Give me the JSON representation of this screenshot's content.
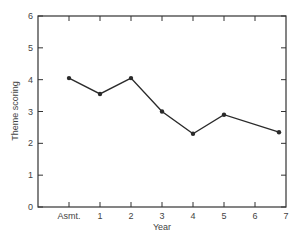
{
  "chart_data": {
    "type": "line",
    "title": "",
    "xlabel": "Year",
    "ylabel": "Theme scoring",
    "categories": [
      "Asmt.",
      "1",
      "2",
      "3",
      "4",
      "5",
      "6",
      "7"
    ],
    "x_tick_labels": [
      "Asmt.",
      "1",
      "2",
      "3",
      "4",
      "5",
      "6",
      "7"
    ],
    "y_tick_labels": [
      "0",
      "1",
      "2",
      "3",
      "4",
      "5",
      "6"
    ],
    "ylim": [
      0,
      6
    ],
    "grid": false,
    "legend": null,
    "series": [
      {
        "name": "Theme scoring",
        "points": [
          {
            "x": "Asmt.",
            "y": 4.05
          },
          {
            "x": "1",
            "y": 3.55
          },
          {
            "x": "2",
            "y": 4.05
          },
          {
            "x": "3",
            "y": 3.0
          },
          {
            "x": "4",
            "y": 2.3
          },
          {
            "x": "5",
            "y": 2.9
          },
          {
            "x": "7",
            "y": 2.35
          }
        ]
      }
    ],
    "colors": {
      "line": "#2a2a2a",
      "axis": "#333333",
      "text": "#444444"
    }
  }
}
